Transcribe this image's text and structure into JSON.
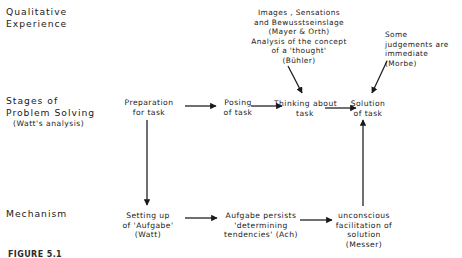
{
  "figure": {
    "caption": "FIGURE 5.1",
    "rows": [
      {
        "label": "Qualitative\nExperience",
        "sublabel": ""
      },
      {
        "label": "Stages of\nProblem Solving",
        "sublabel": "(Watt's analysis)"
      },
      {
        "label": "Mechanism",
        "sublabel": ""
      }
    ],
    "annotations": [
      {
        "name": "images-sensations-annotation",
        "text": "Images , Sensations\nand Bewusstseinslage\n(Mayer & Orth)\nAnalysis of the concept\nof a 'thought'\n(Bühler)"
      },
      {
        "name": "some-judgements-annotation",
        "text": "Some\njudgements are\nimmediate\n(Morbe)"
      }
    ],
    "stages": [
      {
        "name": "stage-preparation",
        "text": "Preparation\nfor task"
      },
      {
        "name": "stage-posing",
        "text": "Posing\nof task"
      },
      {
        "name": "stage-thinking",
        "text": "Thinking about\ntask"
      },
      {
        "name": "stage-solution",
        "text": "Solution\nof task"
      }
    ],
    "mechanisms": [
      {
        "name": "mechanism-setting-up-aufgabe",
        "text": "Setting up\nof 'Aufgabe'\n(Watt)"
      },
      {
        "name": "mechanism-aufgabe-persists",
        "text": "Aufgabe persists\n'determining\ntendencies' (Ach)"
      },
      {
        "name": "mechanism-unconscious-facilitation",
        "text": "unconscious\nfacilitation of\nsolution\n(Messer)"
      }
    ],
    "colors": {
      "ink": "#1a1a1a",
      "background": "#ffffff",
      "arrow": "#1a1a1a"
    }
  }
}
